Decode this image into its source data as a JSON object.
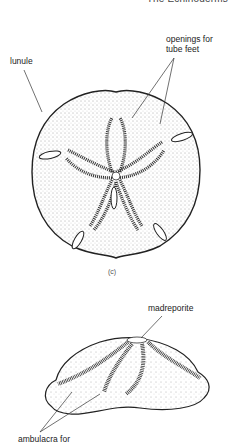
{
  "page": {
    "running_header": "The Echinoderms"
  },
  "figure_top": {
    "labels": {
      "lunule": "lunule",
      "openings_line1": "openings for",
      "openings_line2": "tube feet"
    },
    "caption": "(c)"
  },
  "figure_bottom": {
    "labels": {
      "madreporite": "madreporite",
      "ambulacra": "ambulacra for"
    }
  }
}
